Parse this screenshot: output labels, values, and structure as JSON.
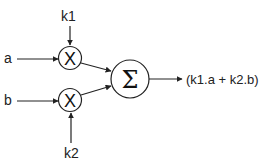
{
  "diagram": {
    "inputs": {
      "a": "a",
      "b": "b",
      "k1": "k1",
      "k2": "k2"
    },
    "nodes": {
      "mult1_symbol": "X",
      "mult2_symbol": "X",
      "sum_symbol": "Σ"
    },
    "output": "(k1.a + k2.b)",
    "colors": {
      "stroke": "#222222",
      "background": "#ffffff"
    }
  }
}
